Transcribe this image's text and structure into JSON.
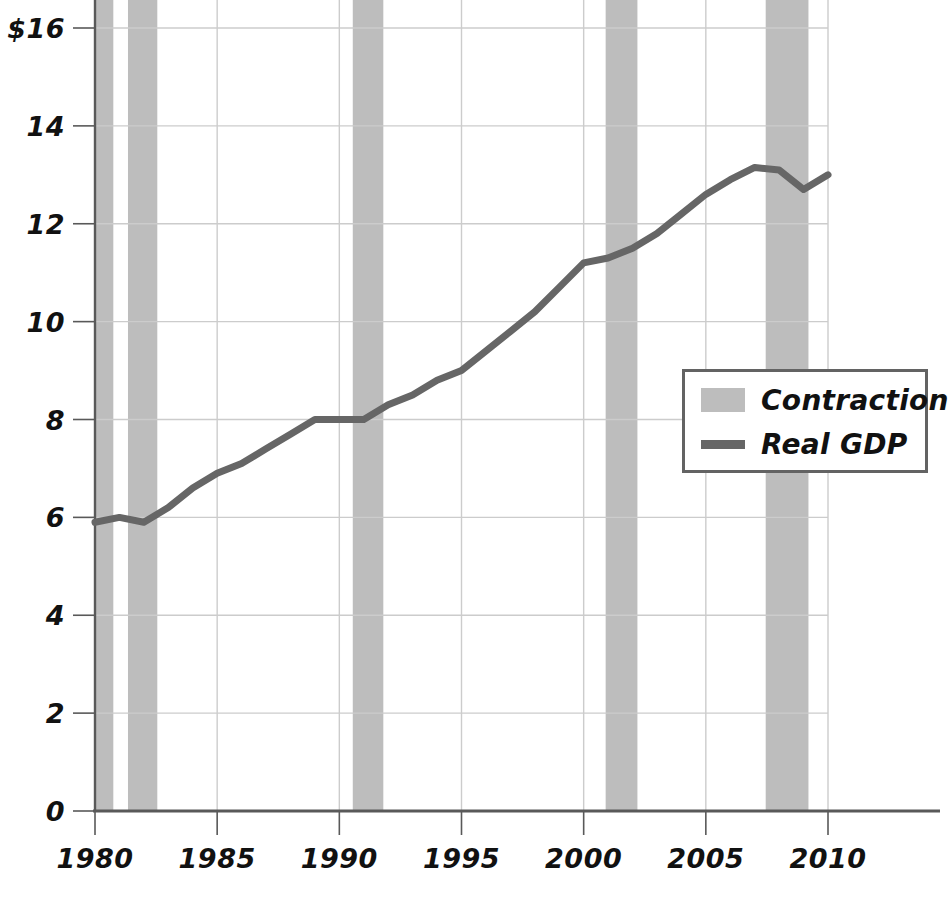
{
  "chart_data": {
    "type": "line",
    "title": "",
    "subtitle": "",
    "xlabel": "",
    "ylabel": "",
    "xlim": [
      1980,
      2010
    ],
    "ylim": [
      0,
      16
    ],
    "grid": true,
    "legend_position": "right-middle",
    "y_ticks": [
      "$16",
      "14",
      "12",
      "10",
      "8",
      "6",
      "4",
      "2",
      "0"
    ],
    "y_tick_values": [
      16,
      14,
      12,
      10,
      8,
      6,
      4,
      2,
      0
    ],
    "x_ticks": [
      "1980",
      "1985",
      "1990",
      "1995",
      "2000",
      "2005",
      "2010"
    ],
    "x_tick_values": [
      1980,
      1985,
      1990,
      1995,
      2000,
      2005,
      2010
    ],
    "series": [
      {
        "name": "Real GDP",
        "color": "#666666",
        "x": [
          1980,
          1981,
          1982,
          1983,
          1984,
          1985,
          1986,
          1987,
          1988,
          1989,
          1990,
          1991,
          1992,
          1993,
          1994,
          1995,
          1996,
          1997,
          1998,
          1999,
          2000,
          2001,
          2002,
          2003,
          2004,
          2005,
          2006,
          2007,
          2008,
          2009,
          2010
        ],
        "values": [
          5.9,
          6.0,
          5.9,
          6.2,
          6.6,
          6.9,
          7.1,
          7.4,
          7.7,
          8.0,
          8.0,
          8.0,
          8.3,
          8.5,
          8.8,
          9.0,
          9.4,
          9.8,
          10.2,
          10.7,
          11.2,
          11.3,
          11.5,
          11.8,
          12.2,
          12.6,
          12.9,
          13.15,
          13.1,
          12.7,
          13.0
        ]
      }
    ],
    "bands": [
      {
        "name": "Contraction",
        "start": 1980.0,
        "end": 1980.75
      },
      {
        "name": "Contraction",
        "start": 1981.35,
        "end": 1982.55
      },
      {
        "name": "Contraction",
        "start": 1990.55,
        "end": 1991.8
      },
      {
        "name": "Contraction",
        "start": 2000.9,
        "end": 2002.2
      },
      {
        "name": "Contraction",
        "start": 2007.45,
        "end": 2009.2
      }
    ],
    "band_color": "#bdbdbd",
    "axis_color": "#595959",
    "grid_color": "#cccccc"
  },
  "legend": {
    "items": [
      {
        "label": "Contraction",
        "swatch": "band"
      },
      {
        "label": "Real GDP",
        "swatch": "line"
      }
    ]
  }
}
